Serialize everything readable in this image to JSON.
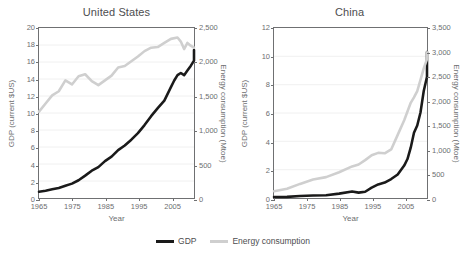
{
  "chart_data": [
    {
      "type": "line",
      "title": "United States",
      "xlabel": "Year",
      "ylabel": "GDP (current $US)",
      "y2label": "Energy consumption (Mtoe)",
      "xlim": [
        1965,
        2012
      ],
      "ylim": [
        0,
        20
      ],
      "y2lim": [
        0,
        2500
      ],
      "xticks": [
        1965,
        1975,
        1985,
        1995,
        2005
      ],
      "yticks": [
        0,
        2,
        4,
        6,
        8,
        10,
        12,
        14,
        16,
        18,
        20
      ],
      "y2ticks": [
        "0",
        "500",
        "1,000",
        "1,500",
        "2,000",
        "2,500"
      ],
      "grid": true,
      "legend_position": "bottom",
      "series": [
        {
          "name": "GDP",
          "axis": "left",
          "color": "#1a1a1a",
          "x": [
            1965,
            1967,
            1969,
            1971,
            1973,
            1975,
            1977,
            1979,
            1981,
            1983,
            1985,
            1987,
            1989,
            1991,
            1993,
            1995,
            1997,
            1999,
            2001,
            2003,
            2005,
            2006,
            2007,
            2008,
            2009,
            2010,
            2011,
            2012
          ],
          "values": [
            0.74,
            0.86,
            1.02,
            1.17,
            1.43,
            1.69,
            2.09,
            2.63,
            3.21,
            3.63,
            4.34,
            4.86,
            5.64,
            6.17,
            6.86,
            7.64,
            8.58,
            9.63,
            10.58,
            11.46,
            13.04,
            13.82,
            14.45,
            14.71,
            14.45,
            14.99,
            15.54,
            16.16
          ],
          "ymax_value": 17.4
        },
        {
          "name": "Energy consumption",
          "axis": "right",
          "color": "#cfcfcf",
          "x": [
            1965,
            1967,
            1969,
            1971,
            1973,
            1975,
            1977,
            1979,
            1981,
            1983,
            1985,
            1987,
            1989,
            1991,
            1993,
            1995,
            1997,
            1999,
            2001,
            2003,
            2005,
            2007,
            2008,
            2009,
            2010,
            2011,
            2012
          ],
          "values": [
            1270,
            1390,
            1510,
            1570,
            1730,
            1670,
            1790,
            1820,
            1720,
            1660,
            1730,
            1800,
            1920,
            1940,
            2010,
            2080,
            2160,
            2210,
            2220,
            2280,
            2340,
            2360,
            2300,
            2190,
            2280,
            2240,
            2210
          ]
        }
      ]
    },
    {
      "type": "line",
      "title": "China",
      "xlabel": "Year",
      "ylabel": "GDP (current $US)",
      "y2label": "Energy consumption (Mtoe)",
      "xlim": [
        1965,
        2012
      ],
      "ylim": [
        0,
        12
      ],
      "y2lim": [
        0,
        3500
      ],
      "xticks": [
        1965,
        1975,
        1985,
        1995,
        2005
      ],
      "yticks": [
        0,
        2,
        4,
        6,
        8,
        10,
        12
      ],
      "y2ticks": [
        "0",
        "500",
        "1,000",
        "1,500",
        "2,000",
        "2,500",
        "3,000",
        "3,500"
      ],
      "grid": true,
      "legend_position": "bottom",
      "series": [
        {
          "name": "GDP",
          "axis": "left",
          "color": "#1a1a1a",
          "x": [
            1965,
            1969,
            1973,
            1977,
            1981,
            1985,
            1989,
            1991,
            1993,
            1995,
            1997,
            1999,
            2001,
            2003,
            2005,
            2006,
            2007,
            2008,
            2009,
            2010,
            2011,
            2012
          ],
          "values": [
            0.07,
            0.08,
            0.14,
            0.17,
            0.2,
            0.31,
            0.46,
            0.38,
            0.44,
            0.73,
            0.96,
            1.09,
            1.34,
            1.66,
            2.29,
            2.75,
            3.55,
            4.6,
            5.12,
            6.04,
            7.55,
            8.56
          ],
          "ymax_value": 10.3
        },
        {
          "name": "Energy consumption",
          "axis": "right",
          "color": "#cfcfcf",
          "x": [
            1965,
            1969,
            1973,
            1977,
            1981,
            1985,
            1989,
            1991,
            1993,
            1995,
            1997,
            1999,
            2001,
            2003,
            2005,
            2007,
            2008,
            2009,
            2010,
            2011,
            2012
          ],
          "values": [
            140,
            190,
            290,
            380,
            430,
            530,
            650,
            690,
            780,
            880,
            930,
            920,
            1000,
            1300,
            1600,
            1960,
            2070,
            2200,
            2430,
            2670,
            2860
          ],
          "ymax_value": 3000
        }
      ]
    }
  ],
  "legend": {
    "entries": [
      {
        "label": "GDP",
        "color": "#1a1a1a"
      },
      {
        "label": "Energy consumption",
        "color": "#cfcfcf"
      }
    ]
  }
}
